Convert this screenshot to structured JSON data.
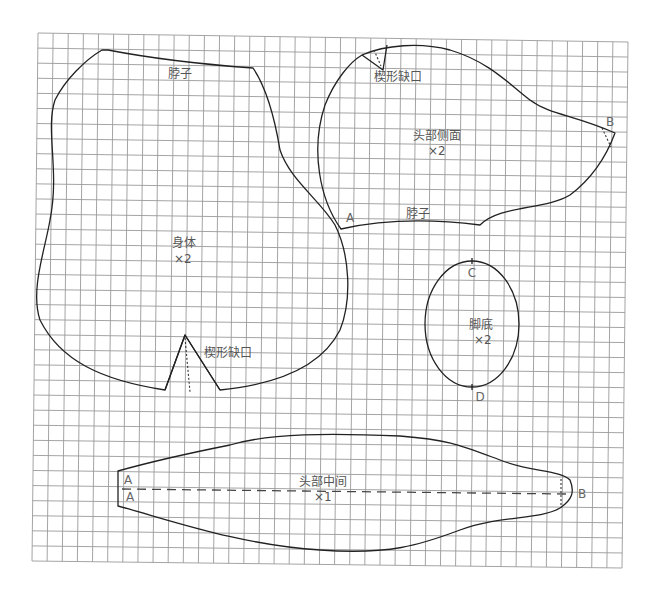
{
  "diagram": {
    "type": "sewing-pattern",
    "grid": {
      "corners": {
        "top_left": [
          38,
          33
        ],
        "top_right": [
          628,
          42
        ],
        "bottom_right": [
          622,
          568
        ],
        "bottom_left": [
          32,
          561
        ]
      },
      "cols": 39,
      "rows": 35,
      "line_color": "#9a9a9a"
    },
    "pieces": {
      "body": {
        "name": "身体",
        "count": "×2",
        "neck_label": "脖子",
        "dart_label": "楔形缺口"
      },
      "head_side": {
        "name": "头部侧面",
        "count": "×2",
        "neck_label": "脖子",
        "dart_label": "楔形缺口",
        "point_a": "A",
        "point_b": "B"
      },
      "sole": {
        "name": "脚底",
        "count": "×2",
        "point_c": "C",
        "point_d": "D"
      },
      "head_middle": {
        "name": "头部中间",
        "count": "×1",
        "point_a_top": "A",
        "point_a_bottom": "A",
        "point_b": "B"
      }
    },
    "colors": {
      "outline": "#222222",
      "label": "#555555",
      "background": "#ffffff"
    }
  }
}
